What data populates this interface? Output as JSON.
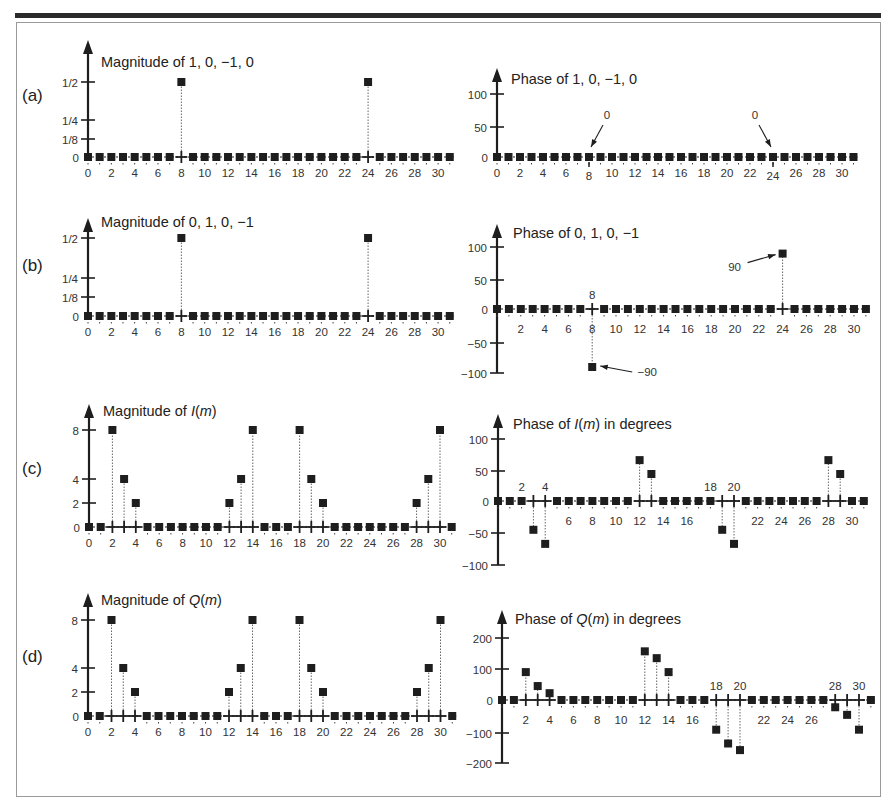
{
  "figure": {
    "panel_labels": [
      "(a)",
      "(b)",
      "(c)",
      "(d)"
    ]
  },
  "chart_data": [
    {
      "id": "a-mag",
      "type": "stem",
      "title": "Magnitude of 1, 0, −1, 0",
      "panel": "(a)",
      "x": [
        0,
        1,
        2,
        3,
        4,
        5,
        6,
        7,
        8,
        9,
        10,
        11,
        12,
        13,
        14,
        15,
        16,
        17,
        18,
        19,
        20,
        21,
        22,
        23,
        24,
        25,
        26,
        27,
        28,
        29,
        30,
        31
      ],
      "values": [
        0,
        0,
        0,
        0,
        0,
        0,
        0,
        0,
        0.5,
        0,
        0,
        0,
        0,
        0,
        0,
        0,
        0,
        0,
        0,
        0,
        0,
        0,
        0,
        0,
        0.5,
        0,
        0,
        0,
        0,
        0,
        0,
        0
      ],
      "yticks": [
        {
          "v": 0,
          "label": "0"
        },
        {
          "v": 0.125,
          "label": "1/8"
        },
        {
          "v": 0.25,
          "label": "1/4"
        },
        {
          "v": 0.5,
          "label": "1/2"
        }
      ],
      "xtick_labels": [
        "0",
        "2",
        "4",
        "6",
        "8",
        "10",
        "12",
        "14",
        "16",
        "18",
        "20",
        "22",
        "24",
        "26",
        "28",
        "30"
      ],
      "annotations": []
    },
    {
      "id": "a-phase",
      "type": "stem",
      "title": "Phase of 1, 0, −1, 0",
      "panel": "(a)",
      "x": [
        0,
        1,
        2,
        3,
        4,
        5,
        6,
        7,
        8,
        9,
        10,
        11,
        12,
        13,
        14,
        15,
        16,
        17,
        18,
        19,
        20,
        21,
        22,
        23,
        24,
        25,
        26,
        27,
        28,
        29,
        30,
        31
      ],
      "values": [
        0,
        0,
        0,
        0,
        0,
        0,
        0,
        0,
        0,
        0,
        0,
        0,
        0,
        0,
        0,
        0,
        0,
        0,
        0,
        0,
        0,
        0,
        0,
        0,
        0,
        0,
        0,
        0,
        0,
        0,
        0,
        0
      ],
      "yticks": [
        {
          "v": 0,
          "label": "0"
        },
        {
          "v": 50,
          "label": "50"
        },
        {
          "v": 100,
          "label": "100"
        }
      ],
      "xtick_labels": [
        "0",
        "2",
        "4",
        "6",
        "8",
        "10",
        "12",
        "14",
        "16",
        "18",
        "20",
        "22",
        "24",
        "26",
        "28",
        "30"
      ],
      "annotations": [
        {
          "text": "0",
          "at": 8
        },
        {
          "text": "0",
          "at": 24
        }
      ]
    },
    {
      "id": "b-mag",
      "type": "stem",
      "title": "Magnitude of 0, 1, 0, −1",
      "panel": "(b)",
      "x": [
        0,
        1,
        2,
        3,
        4,
        5,
        6,
        7,
        8,
        9,
        10,
        11,
        12,
        13,
        14,
        15,
        16,
        17,
        18,
        19,
        20,
        21,
        22,
        23,
        24,
        25,
        26,
        27,
        28,
        29,
        30,
        31
      ],
      "values": [
        0,
        0,
        0,
        0,
        0,
        0,
        0,
        0,
        0.5,
        0,
        0,
        0,
        0,
        0,
        0,
        0,
        0,
        0,
        0,
        0,
        0,
        0,
        0,
        0,
        0.5,
        0,
        0,
        0,
        0,
        0,
        0,
        0
      ],
      "yticks": [
        {
          "v": 0,
          "label": "0"
        },
        {
          "v": 0.125,
          "label": "1/8"
        },
        {
          "v": 0.25,
          "label": "1/4"
        },
        {
          "v": 0.5,
          "label": "1/2"
        }
      ],
      "xtick_labels": [
        "0",
        "2",
        "4",
        "6",
        "8",
        "10",
        "12",
        "14",
        "16",
        "18",
        "20",
        "22",
        "24",
        "26",
        "28",
        "30"
      ],
      "annotations": []
    },
    {
      "id": "b-phase",
      "type": "stem",
      "title": "Phase of 0, 1, 0, −1",
      "panel": "(b)",
      "x": [
        0,
        1,
        2,
        3,
        4,
        5,
        6,
        7,
        8,
        9,
        10,
        11,
        12,
        13,
        14,
        15,
        16,
        17,
        18,
        19,
        20,
        21,
        22,
        23,
        24,
        25,
        26,
        27,
        28,
        29,
        30,
        31
      ],
      "values": [
        0,
        0,
        0,
        0,
        0,
        0,
        0,
        0,
        -90,
        0,
        0,
        0,
        0,
        0,
        0,
        0,
        0,
        0,
        0,
        0,
        0,
        0,
        0,
        0,
        90,
        0,
        0,
        0,
        0,
        0,
        0,
        0
      ],
      "yticks": [
        {
          "v": -100,
          "label": "−100"
        },
        {
          "v": -50,
          "label": "−50"
        },
        {
          "v": 0,
          "label": "0"
        },
        {
          "v": 50,
          "label": "50"
        },
        {
          "v": 100,
          "label": "100"
        }
      ],
      "xtick_labels": [
        "2",
        "4",
        "6",
        "8",
        "10",
        "12",
        "14",
        "16",
        "18",
        "20",
        "22",
        "24",
        "26",
        "28",
        "30"
      ],
      "annotations": [
        {
          "text": "−90",
          "at": 8
        },
        {
          "text": "90",
          "at": 24
        }
      ]
    },
    {
      "id": "c-mag",
      "type": "stem",
      "title": "Magnitude of I(m)",
      "panel": "(c)",
      "x": [
        0,
        1,
        2,
        3,
        4,
        5,
        6,
        7,
        8,
        9,
        10,
        11,
        12,
        13,
        14,
        15,
        16,
        17,
        18,
        19,
        20,
        21,
        22,
        23,
        24,
        25,
        26,
        27,
        28,
        29,
        30,
        31
      ],
      "values": [
        0,
        0,
        8,
        4,
        2,
        0,
        0,
        0,
        0,
        0,
        0,
        0,
        2,
        4,
        8,
        0,
        0,
        0,
        8,
        4,
        2,
        0,
        0,
        0,
        0,
        0,
        0,
        0,
        2,
        4,
        8,
        0
      ],
      "yticks": [
        {
          "v": 0,
          "label": "0"
        },
        {
          "v": 2,
          "label": "2"
        },
        {
          "v": 4,
          "label": "4"
        },
        {
          "v": 8,
          "label": "8"
        }
      ],
      "xtick_labels": [
        "0",
        "2",
        "4",
        "6",
        "8",
        "10",
        "12",
        "14",
        "16",
        "18",
        "20",
        "22",
        "24",
        "26",
        "28",
        "30"
      ],
      "annotations": []
    },
    {
      "id": "c-phase",
      "type": "stem",
      "title": "Phase of I(m) in degrees",
      "panel": "(c)",
      "x": [
        0,
        1,
        2,
        3,
        4,
        5,
        6,
        7,
        8,
        9,
        10,
        11,
        12,
        13,
        14,
        15,
        16,
        17,
        18,
        19,
        20,
        21,
        22,
        23,
        24,
        25,
        26,
        27,
        28,
        29,
        30,
        31
      ],
      "values": [
        0,
        0,
        0,
        -45,
        -67,
        0,
        0,
        0,
        0,
        0,
        0,
        0,
        67,
        45,
        0,
        0,
        0,
        0,
        0,
        -45,
        -67,
        0,
        0,
        0,
        0,
        0,
        0,
        0,
        67,
        45,
        0,
        0
      ],
      "yticks": [
        {
          "v": -100,
          "label": "−100"
        },
        {
          "v": -50,
          "label": "−50"
        },
        {
          "v": 0,
          "label": "0"
        },
        {
          "v": 50,
          "label": "50"
        },
        {
          "v": 100,
          "label": "100"
        }
      ],
      "xtick_labels_above": [
        "2",
        "4",
        "18",
        "20"
      ],
      "xtick_labels": [
        "6",
        "8",
        "10",
        "12",
        "14",
        "16",
        "22",
        "24",
        "26",
        "28",
        "30"
      ],
      "annotations": []
    },
    {
      "id": "d-mag",
      "type": "stem",
      "title": "Magnitude of Q(m)",
      "panel": "(d)",
      "x": [
        0,
        1,
        2,
        3,
        4,
        5,
        6,
        7,
        8,
        9,
        10,
        11,
        12,
        13,
        14,
        15,
        16,
        17,
        18,
        19,
        20,
        21,
        22,
        23,
        24,
        25,
        26,
        27,
        28,
        29,
        30,
        31
      ],
      "values": [
        0,
        0,
        8,
        4,
        2,
        0,
        0,
        0,
        0,
        0,
        0,
        0,
        2,
        4,
        8,
        0,
        0,
        0,
        8,
        4,
        2,
        0,
        0,
        0,
        0,
        0,
        0,
        0,
        2,
        4,
        8,
        0
      ],
      "yticks": [
        {
          "v": 0,
          "label": "0"
        },
        {
          "v": 2,
          "label": "2"
        },
        {
          "v": 4,
          "label": "4"
        },
        {
          "v": 8,
          "label": "8"
        }
      ],
      "xtick_labels": [
        "0",
        "2",
        "4",
        "6",
        "8",
        "10",
        "12",
        "14",
        "16",
        "18",
        "20",
        "22",
        "24",
        "26",
        "28",
        "30"
      ],
      "annotations": []
    },
    {
      "id": "d-phase",
      "type": "stem",
      "title": "Phase of Q(m) in degrees",
      "panel": "(d)",
      "x": [
        0,
        1,
        2,
        3,
        4,
        5,
        6,
        7,
        8,
        9,
        10,
        11,
        12,
        13,
        14,
        15,
        16,
        17,
        18,
        19,
        20,
        21,
        22,
        23,
        24,
        25,
        26,
        27,
        28,
        29,
        30,
        31
      ],
      "values": [
        0,
        0,
        90,
        45,
        22,
        0,
        0,
        0,
        0,
        0,
        0,
        0,
        157,
        135,
        90,
        0,
        0,
        0,
        -90,
        -135,
        -157,
        0,
        0,
        0,
        0,
        0,
        0,
        0,
        -22,
        -45,
        -90,
        0
      ],
      "yticks": [
        {
          "v": -200,
          "label": "−200"
        },
        {
          "v": -100,
          "label": "−100"
        },
        {
          "v": 0,
          "label": "0"
        },
        {
          "v": 100,
          "label": "100"
        },
        {
          "v": 200,
          "label": "200"
        }
      ],
      "xtick_labels_above": [
        "18",
        "20",
        "28",
        "30"
      ],
      "xtick_labels": [
        "2",
        "4",
        "6",
        "8",
        "10",
        "12",
        "14",
        "16",
        "22",
        "24",
        "26"
      ],
      "annotations": []
    }
  ]
}
